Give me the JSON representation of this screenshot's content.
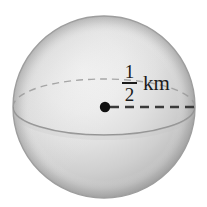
{
  "figure": {
    "shape": "sphere",
    "background_color": "#ffffff"
  },
  "sphere": {
    "center_x": 104,
    "center_y": 107,
    "radius_px": 91,
    "fill_light": "#f2f2f2",
    "fill_mid": "#d2d2d2",
    "fill_dark": "#a9a9a9",
    "outline_color": "#9a9a9a"
  },
  "equator": {
    "front_arc_style": "solid",
    "back_arc_style": "dashed",
    "color": "#8f8f8f",
    "rx": 91,
    "ry": 28
  },
  "radius": {
    "line_style": "dashed",
    "color": "#3a3a3a",
    "center_dot_color": "#111111",
    "start_x": 104,
    "start_y": 107,
    "end_x": 198,
    "end_y": 107
  },
  "label": {
    "numerator": "1",
    "denominator": "2",
    "unit": "km",
    "full_text": "1/2 km",
    "color": "#1b1b1b"
  }
}
